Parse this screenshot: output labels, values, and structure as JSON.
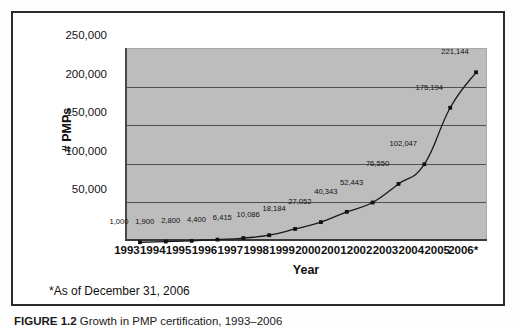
{
  "figure": {
    "caption_label": "FIGURE 1.2",
    "caption_text": "Growth in PMP certification, 1993–2006"
  },
  "footnote": "*As of December 31, 2006",
  "axes": {
    "y_title": "# PMPs",
    "x_title": "Year",
    "y_ticks": [
      "250,000",
      "200,000",
      "150,000",
      "100,000",
      "50,000"
    ],
    "x_ticks": [
      "1993",
      "1994",
      "1995",
      "1996",
      "1997",
      "1998",
      "1999",
      "2000",
      "2001",
      "2002",
      "2003",
      "2004",
      "2005",
      "2006*"
    ]
  },
  "colors": {
    "plot_background": "#bdbdbd",
    "gridline": "#4f4f4f",
    "series_line": "#1a1a1a",
    "marker": "#111111",
    "frame": "#2c2c2c"
  },
  "chart_data": {
    "type": "line",
    "title": "Growth in PMP certification, 1993–2006",
    "xlabel": "Year",
    "ylabel": "# PMPs",
    "ylim": [
      0,
      250000
    ],
    "grid": true,
    "legend": "none",
    "categories": [
      "1993",
      "1994",
      "1995",
      "1996",
      "1997",
      "1998",
      "1999",
      "2000",
      "2001",
      "2002",
      "2003",
      "2004",
      "2005",
      "2006*"
    ],
    "values": [
      1000,
      1900,
      2800,
      4400,
      6415,
      10086,
      18184,
      27052,
      40343,
      52443,
      76550,
      102047,
      175194,
      221144
    ],
    "data_labels": [
      "1,000",
      "1,900",
      "2,800",
      "4,400",
      "6,415",
      "10,086",
      "18,184",
      "27,052",
      "40,343",
      "52,443",
      "76,550",
      "102,047",
      "175,194",
      "221,144"
    ],
    "annotations": [
      "*As of December 31, 2006"
    ]
  }
}
